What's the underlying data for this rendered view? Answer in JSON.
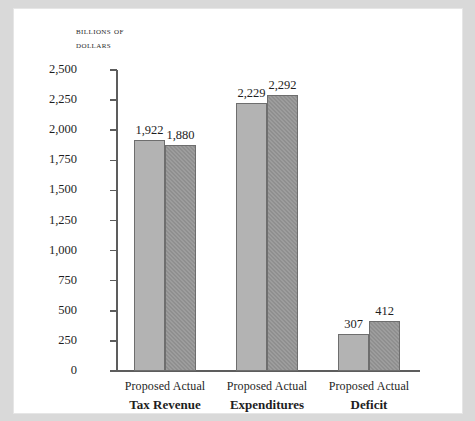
{
  "chart_data": {
    "type": "bar",
    "title": "",
    "ylabel_line1": "Billions of",
    "ylabel_line2": "dollars",
    "xlabel": "",
    "ylim": [
      0,
      2500
    ],
    "grid": false,
    "legend": "none",
    "categories": [
      "Tax Revenue",
      "Expenditures",
      "Deficit"
    ],
    "series": [
      {
        "name": "Proposed",
        "values": [
          1922,
          2229,
          307
        ],
        "labels": [
          "1,922",
          "2,229",
          "307"
        ],
        "color": "#b3b3b3"
      },
      {
        "name": "Actual",
        "values": [
          1880,
          2292,
          412
        ],
        "labels": [
          "1,880",
          "2,292",
          "412"
        ],
        "color": "#8f8f8f"
      }
    ],
    "yticks": [
      0,
      250,
      500,
      750,
      1000,
      1250,
      1500,
      1750,
      2000,
      2250,
      2500
    ],
    "ytick_labels": [
      "0",
      "250",
      "500",
      "750",
      "1,000",
      "1,250",
      "1,500",
      "1,750",
      "2,000",
      "2,250",
      "2,500"
    ]
  },
  "groups": [
    {
      "name": "Tax Revenue",
      "proposed_label": "Proposed",
      "actual_label": "Actual"
    },
    {
      "name": "Expenditures",
      "proposed_label": "Proposed",
      "actual_label": "Actual"
    },
    {
      "name": "Deficit",
      "proposed_label": "Proposed",
      "actual_label": "Actual"
    }
  ]
}
